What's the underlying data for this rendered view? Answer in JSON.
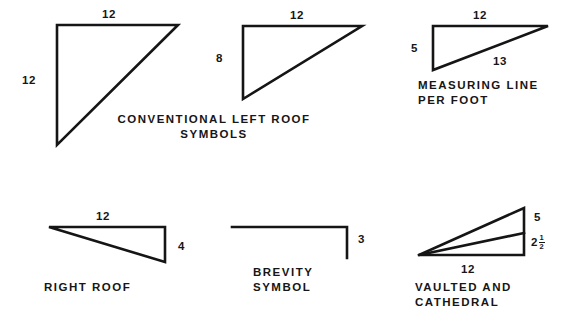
{
  "sheet": {
    "title": "Roof Pitch Symbol Conventions",
    "background_color": "#ffffff",
    "ink_color": "#151515"
  },
  "figures": [
    {
      "id": "conventional-left-roof",
      "shape": "right-triangle-apex-bottom-left",
      "caption_lines": [
        "CONVENTIONAL  LEFT  ROOF",
        "SYMBOLS"
      ],
      "dimensions": {
        "top": "12",
        "left": "12"
      }
    },
    {
      "id": "left-roof-8-12",
      "shape": "right-triangle-apex-bottom-left",
      "caption_lines": [],
      "dimensions": {
        "top": "12",
        "left": "8"
      }
    },
    {
      "id": "measuring-line-per-foot",
      "shape": "right-triangle-apex-bottom-left",
      "caption_lines": [
        "MEASURING LINE",
        "PER  FOOT"
      ],
      "dimensions": {
        "top": "12",
        "left": "5",
        "hypotenuse": "13"
      }
    },
    {
      "id": "right-roof",
      "shape": "right-triangle-apex-left",
      "caption_lines": [
        "RIGHT  ROOF"
      ],
      "dimensions": {
        "top": "12",
        "right": "4"
      }
    },
    {
      "id": "brevity-symbol",
      "shape": "horizontal-line-with-right-drop",
      "caption_lines": [
        "BREVITY",
        "SYMBOL"
      ],
      "dimensions": {
        "right": "3"
      }
    },
    {
      "id": "vaulted-and-cathedral",
      "shape": "two-stacked-triangles-shared-left-apex",
      "caption_lines": [
        "VAULTED  AND",
        "CATHEDRAL"
      ],
      "dimensions": {
        "bottom": "12",
        "right_upper": "5",
        "right_lower_whole": "2",
        "right_lower_num": "1",
        "right_lower_den": "2"
      }
    }
  ]
}
